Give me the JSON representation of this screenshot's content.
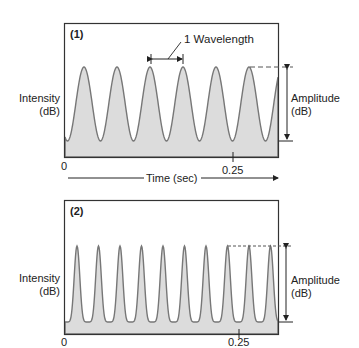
{
  "chart_data": [
    {
      "type": "line",
      "panel_label": "(1)",
      "title": "",
      "ylabel": "Intensity (dB)",
      "xlabel": "Time (sec)",
      "x_ticks": [
        "0",
        "0.25"
      ],
      "annotations": [
        "1 Wavelength",
        "Amplitude (dB)"
      ],
      "waveform": "sinusoid",
      "cycles_visible": 6.5,
      "fill": "#dcdcdc",
      "line_color": "#666666"
    },
    {
      "type": "line",
      "panel_label": "(2)",
      "title": "",
      "ylabel": "Intensity (dB)",
      "xlabel": "",
      "x_ticks": [
        "0",
        "0.25"
      ],
      "annotations": [
        "Amplitude (dB)"
      ],
      "waveform": "narrow-peaked periodic",
      "cycles_visible": 10.5,
      "fill": "#dcdcdc",
      "line_color": "#666666"
    }
  ],
  "panel1": {
    "label": "(1)",
    "ylabel_line1": "Intensity",
    "ylabel_line2": "(dB)",
    "wavelength_label": "1 Wavelength",
    "amplitude_line1": "Amplitude",
    "amplitude_line2": "(dB)",
    "tick0": "0",
    "tick1": "0.25",
    "time_label": "Time (sec)"
  },
  "panel2": {
    "label": "(2)",
    "ylabel_line1": "Intensity",
    "ylabel_line2": "(dB)",
    "amplitude_line1": "Amplitude",
    "amplitude_line2": "(dB)",
    "tick0": "0",
    "tick1": "0.25"
  }
}
